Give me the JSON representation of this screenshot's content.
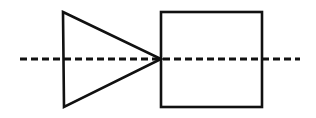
{
  "canvas": {
    "width": 316,
    "height": 118,
    "background_color": "#ffffff",
    "title": "Triangle and square bisected by a dashed axis line"
  },
  "style": {
    "stroke_color": "#111111",
    "shape_stroke_width": 2.6,
    "axis_stroke_width": 3.0,
    "fill": "none",
    "axis_dash_pattern": "7 4"
  },
  "shapes": [
    {
      "name": "triangle",
      "kind": "polygon",
      "label": "right-pointing triangle",
      "fill": "none",
      "points": "63,12 161,59 64,107",
      "vertices": [
        {
          "label": "top-left",
          "x": 63,
          "y": 12
        },
        {
          "label": "apex-right",
          "x": 161,
          "y": 59
        },
        {
          "label": "bottom-left",
          "x": 64,
          "y": 107
        }
      ]
    },
    {
      "name": "square",
      "kind": "rect",
      "label": "square",
      "fill": "none",
      "x": 161,
      "y": 12,
      "width": 101,
      "height": 95
    }
  ],
  "axis": {
    "name": "dashed-center-line",
    "label": "horizontal dashed axis",
    "orientation": "horizontal",
    "x1": 20,
    "y1": 59,
    "x2": 300,
    "y2": 59,
    "dash": "7 4"
  }
}
